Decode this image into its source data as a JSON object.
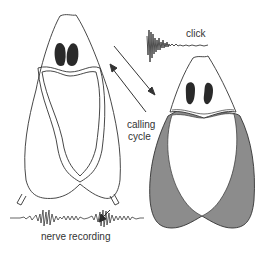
{
  "labels": {
    "click": "click",
    "calling": "calling",
    "cycle": "cycle",
    "nerve_recording": "nerve recording"
  },
  "colors": {
    "outline": "#333333",
    "gland": "#2a2a2a",
    "inflated_fill": "#8c8c8c",
    "background": "#ffffff"
  },
  "figures": [
    {
      "name": "resting-state",
      "position": "left",
      "sac_state": "deflated"
    },
    {
      "name": "calling-state",
      "position": "right",
      "sac_state": "inflated-shaded"
    }
  ]
}
